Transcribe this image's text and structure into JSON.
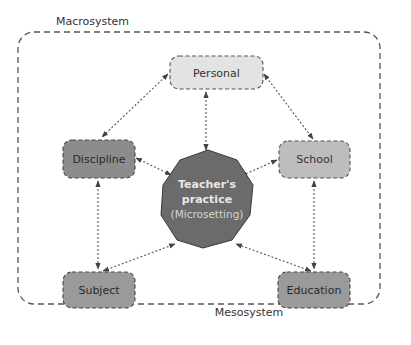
{
  "diagram": {
    "outer_label": "Macrosystem",
    "inner_label": "Mesosystem",
    "center": {
      "line1": "Teacher's",
      "line2": "practice",
      "line3": "(Microsetting)",
      "fill": "#6b6b6b",
      "text_color": "#e8e8e8",
      "sub_text_color": "#d0d0d0"
    },
    "nodes": [
      {
        "id": "personal",
        "label": "Personal",
        "fill": "#e3e3e3"
      },
      {
        "id": "discipline",
        "label": "Discipline",
        "fill": "#8c8c8c"
      },
      {
        "id": "school",
        "label": "School",
        "fill": "#bdbdbd"
      },
      {
        "id": "subject",
        "label": "Subject",
        "fill": "#9a9a9a"
      },
      {
        "id": "education",
        "label": "Education",
        "fill": "#9a9a9a"
      }
    ],
    "edges": [
      {
        "from": "personal",
        "to": "discipline",
        "style": "dotted",
        "arrows": "both"
      },
      {
        "from": "personal",
        "to": "school",
        "style": "dotted",
        "arrows": "both"
      },
      {
        "from": "personal",
        "to": "center",
        "style": "dotted",
        "arrows": "both"
      },
      {
        "from": "discipline",
        "to": "center",
        "style": "dotted",
        "arrows": "both"
      },
      {
        "from": "school",
        "to": "center",
        "style": "dotted",
        "arrows": "both"
      },
      {
        "from": "discipline",
        "to": "subject",
        "style": "dotted",
        "arrows": "both"
      },
      {
        "from": "school",
        "to": "education",
        "style": "dotted",
        "arrows": "both"
      },
      {
        "from": "subject",
        "to": "center",
        "style": "dotted",
        "arrows": "both"
      },
      {
        "from": "education",
        "to": "center",
        "style": "dotted",
        "arrows": "both"
      }
    ],
    "colors": {
      "border": "#555555",
      "text": "#333333",
      "arrow": "#555555"
    }
  }
}
